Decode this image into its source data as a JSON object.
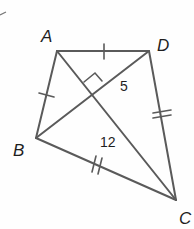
{
  "diagram": {
    "type": "kite",
    "vertices": [
      {
        "label": "A",
        "x": 57,
        "y": 51
      },
      {
        "label": "D",
        "x": 149,
        "y": 51
      },
      {
        "label": "B",
        "x": 36,
        "y": 138
      },
      {
        "label": "C",
        "x": 176,
        "y": 200
      }
    ],
    "segment_labels": {
      "short": "5",
      "long": "12"
    },
    "markings": {
      "single_tick": [
        "AD",
        "AB"
      ],
      "double_tick": [
        "DC",
        "BC"
      ],
      "right_angle": "diagonals perpendicular"
    },
    "colors": {
      "line": "#5a5a5a",
      "text": "#1e1e1e"
    }
  }
}
